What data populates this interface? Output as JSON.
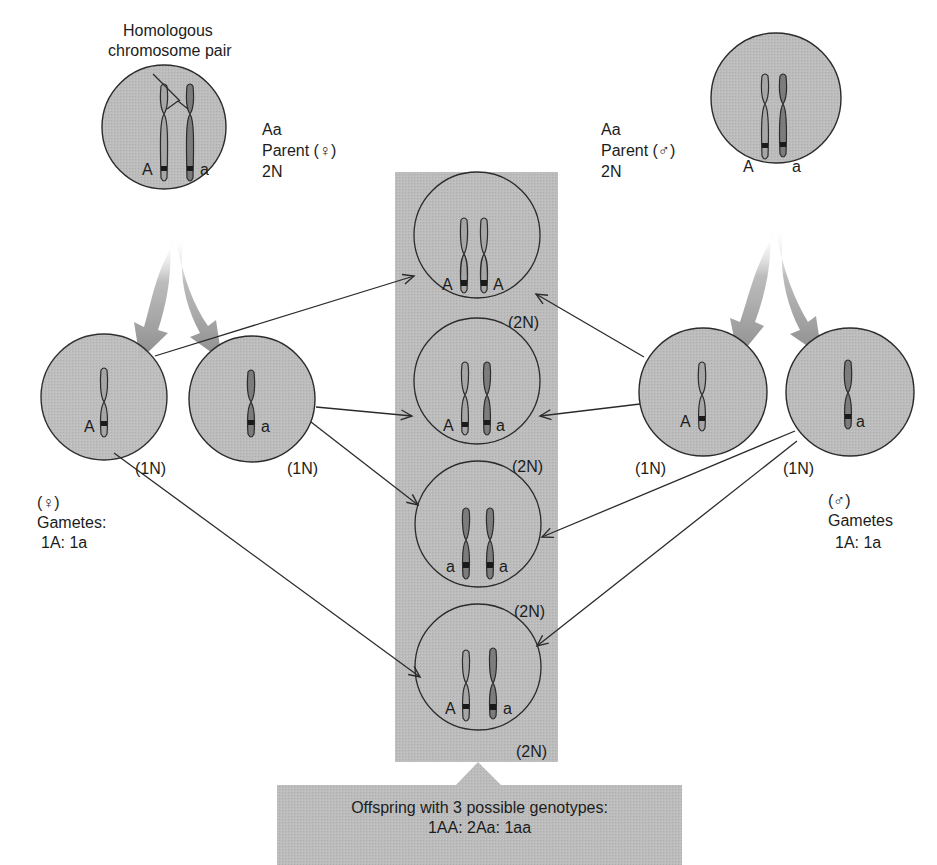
{
  "title_label": {
    "line1": "Homologous",
    "line2": "chromosome pair"
  },
  "female_parent": {
    "genotype": "Aa",
    "label": "Parent (♀)",
    "ploidy": "2N",
    "alleles": [
      "A",
      "a"
    ]
  },
  "male_parent": {
    "genotype": "Aa",
    "label": "Parent (♂)",
    "ploidy": "2N",
    "alleles": [
      "A",
      "a"
    ]
  },
  "female_gametes": {
    "symbol": "(♀)",
    "title": "Gametes:",
    "ratio": "1A: 1a",
    "cells": [
      {
        "allele": "A",
        "ploidy": "(1N)"
      },
      {
        "allele": "a",
        "ploidy": "(1N)"
      }
    ]
  },
  "male_gametes": {
    "symbol": "(♂)",
    "title": "Gametes",
    "ratio": "1A: 1a",
    "cells": [
      {
        "allele": "A",
        "ploidy": "(1N)"
      },
      {
        "allele": "a",
        "ploidy": "(1N)"
      }
    ]
  },
  "offspring": [
    {
      "left": "A",
      "right": "A",
      "ploidy": "(2N)"
    },
    {
      "left": "A",
      "right": "a",
      "ploidy": "(2N)"
    },
    {
      "left": "a",
      "right": "a",
      "ploidy": "(2N)"
    },
    {
      "left": "A",
      "right": "a",
      "ploidy": "(2N)"
    }
  ],
  "summary": {
    "line1": "Offspring with 3 possible genotypes:",
    "line2": "1AA: 2Aa: 1aa"
  },
  "colors": {
    "cell_fill": "#b9b9b9",
    "column_fill": "#b3b3b3",
    "chrom_light": "#a6a6a6",
    "chrom_dark": "#7c7c7c",
    "outline": "#2b2b2b",
    "arrow_fill": "#8e8e8e"
  }
}
